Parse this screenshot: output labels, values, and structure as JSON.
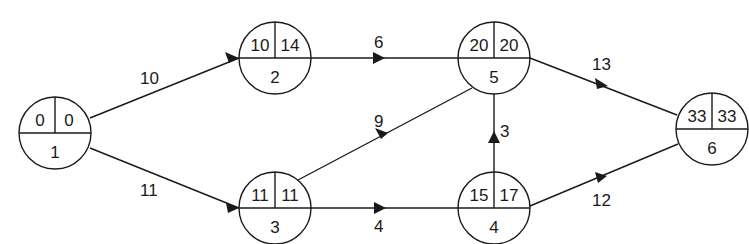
{
  "title_fragment": "",
  "nodes": [
    {
      "id": "1",
      "es": "0",
      "ls": "0",
      "cx": 55,
      "cy": 133
    },
    {
      "id": "2",
      "es": "10",
      "ls": "14",
      "cx": 275,
      "cy": 58
    },
    {
      "id": "3",
      "es": "11",
      "ls": "11",
      "cx": 275,
      "cy": 208
    },
    {
      "id": "4",
      "es": "15",
      "ls": "17",
      "cx": 494,
      "cy": 208
    },
    {
      "id": "5",
      "es": "20",
      "ls": "20",
      "cx": 494,
      "cy": 58
    },
    {
      "id": "6",
      "es": "33",
      "ls": "33",
      "cx": 712,
      "cy": 129
    }
  ],
  "edges": [
    {
      "from": "1",
      "to": "2",
      "duration": "10"
    },
    {
      "from": "1",
      "to": "3",
      "duration": "11"
    },
    {
      "from": "2",
      "to": "5",
      "duration": "6"
    },
    {
      "from": "3",
      "to": "5",
      "duration": "9"
    },
    {
      "from": "3",
      "to": "4",
      "duration": "4"
    },
    {
      "from": "4",
      "to": "5",
      "duration": "3"
    },
    {
      "from": "5",
      "to": "6",
      "duration": "13"
    },
    {
      "from": "4",
      "to": "6",
      "duration": "12"
    }
  ],
  "colors": {
    "stroke": "#1a1a1a",
    "background": "#ffffff"
  }
}
